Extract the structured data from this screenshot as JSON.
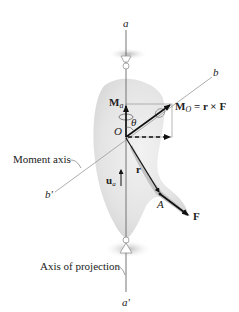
{
  "diagram": {
    "axis_a": {
      "top_label": "a",
      "bottom_label": "a'"
    },
    "axis_b": {
      "top_label": "b",
      "bottom_label": "b'"
    },
    "origin_label": "O",
    "angle_label": "θ",
    "moment_axis_label": "Moment axis",
    "projection_axis_label": "Axis of projection",
    "vectors": {
      "moment_about_axis": {
        "symbol": "M",
        "subscript": "a"
      },
      "moment_about_point": {
        "symbol": "M",
        "subscript": "O",
        "equation": " = r × F"
      },
      "position": {
        "symbol": "r"
      },
      "force": {
        "symbol": "F"
      },
      "unit_vector": {
        "symbol": "u",
        "subscript": "a"
      }
    },
    "point_A_label": "A",
    "colors": {
      "axis_line": "#666666",
      "vector": "#111111",
      "body_shading": "#d9d9d9",
      "bearing_shadow": "#bdbdbd"
    }
  }
}
